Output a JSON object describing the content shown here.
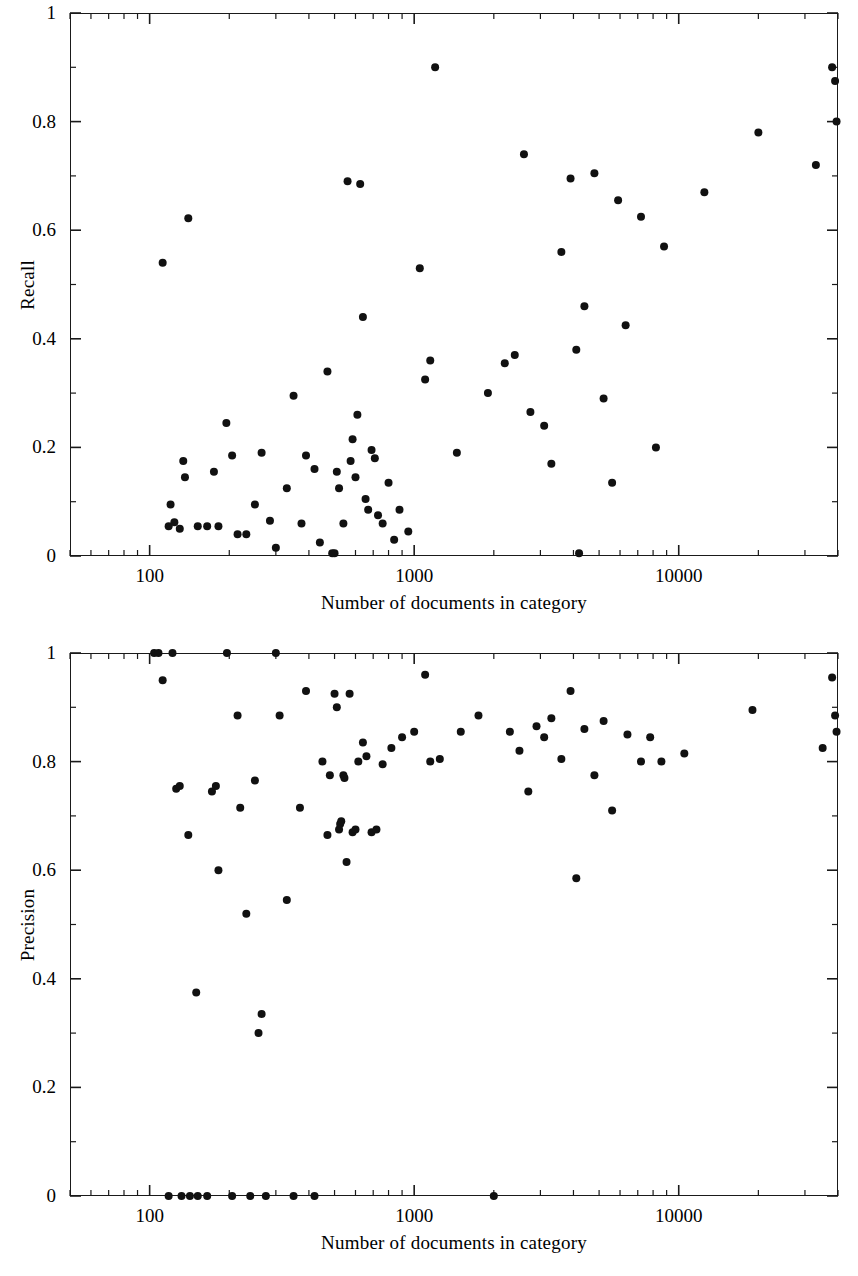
{
  "figure": {
    "background": "#ffffff",
    "ink_color": "#111111",
    "panel_count": 2
  },
  "chart_data": [
    {
      "type": "scatter",
      "id": "recall-vs-category-size",
      "title": "",
      "xlabel": "Number of documents in category",
      "ylabel": "Recall",
      "xscale": "log",
      "yscale": "linear",
      "xlim": [
        50,
        40000
      ],
      "ylim": [
        0,
        1
      ],
      "grid": false,
      "legend": null,
      "xticks_major": [
        100,
        1000,
        10000
      ],
      "xtick_labels": [
        "100",
        "1000",
        "10000"
      ],
      "yticks_major": [
        0,
        0.2,
        0.4,
        0.6,
        0.8,
        1
      ],
      "ytick_labels": [
        "0",
        "0.2",
        "0.4",
        "0.6",
        "0.8",
        "1"
      ],
      "yticks_minor": [
        0.1,
        0.3,
        0.5,
        0.7,
        0.9
      ],
      "marker": "filled-circle",
      "marker_color": "#111111",
      "points": [
        [
          112,
          0.54
        ],
        [
          118,
          0.055
        ],
        [
          120,
          0.095
        ],
        [
          124,
          0.062
        ],
        [
          130,
          0.05
        ],
        [
          134,
          0.175
        ],
        [
          136,
          0.145
        ],
        [
          140,
          0.622
        ],
        [
          152,
          0.055
        ],
        [
          165,
          0.055
        ],
        [
          175,
          0.155
        ],
        [
          182,
          0.055
        ],
        [
          195,
          0.245
        ],
        [
          205,
          0.185
        ],
        [
          215,
          0.04
        ],
        [
          232,
          0.04
        ],
        [
          250,
          0.095
        ],
        [
          265,
          0.19
        ],
        [
          285,
          0.065
        ],
        [
          300,
          0.015
        ],
        [
          330,
          0.125
        ],
        [
          350,
          0.295
        ],
        [
          375,
          0.06
        ],
        [
          390,
          0.185
        ],
        [
          420,
          0.16
        ],
        [
          440,
          0.025
        ],
        [
          470,
          0.34
        ],
        [
          490,
          0.005
        ],
        [
          500,
          0.005
        ],
        [
          510,
          0.155
        ],
        [
          520,
          0.125
        ],
        [
          540,
          0.06
        ],
        [
          560,
          0.69
        ],
        [
          575,
          0.175
        ],
        [
          585,
          0.215
        ],
        [
          600,
          0.145
        ],
        [
          610,
          0.26
        ],
        [
          625,
          0.685
        ],
        [
          640,
          0.44
        ],
        [
          655,
          0.105
        ],
        [
          670,
          0.085
        ],
        [
          690,
          0.195
        ],
        [
          710,
          0.18
        ],
        [
          730,
          0.075
        ],
        [
          760,
          0.06
        ],
        [
          800,
          0.135
        ],
        [
          840,
          0.03
        ],
        [
          880,
          0.085
        ],
        [
          950,
          0.045
        ],
        [
          1050,
          0.53
        ],
        [
          1100,
          0.325
        ],
        [
          1150,
          0.36
        ],
        [
          1200,
          0.9
        ],
        [
          1450,
          0.19
        ],
        [
          1900,
          0.3
        ],
        [
          2200,
          0.355
        ],
        [
          2400,
          0.37
        ],
        [
          2600,
          0.74
        ],
        [
          2750,
          0.265
        ],
        [
          3100,
          0.24
        ],
        [
          3300,
          0.17
        ],
        [
          3600,
          0.56
        ],
        [
          3900,
          0.695
        ],
        [
          4100,
          0.38
        ],
        [
          4200,
          0.005
        ],
        [
          4400,
          0.46
        ],
        [
          4800,
          0.705
        ],
        [
          5200,
          0.29
        ],
        [
          5600,
          0.135
        ],
        [
          5900,
          0.655
        ],
        [
          6300,
          0.425
        ],
        [
          7200,
          0.625
        ],
        [
          8200,
          0.2
        ],
        [
          8800,
          0.57
        ],
        [
          12500,
          0.67
        ],
        [
          20000,
          0.78
        ],
        [
          33000,
          0.72
        ],
        [
          38000,
          0.9
        ],
        [
          39000,
          0.875
        ],
        [
          39500,
          0.8
        ]
      ]
    },
    {
      "type": "scatter",
      "id": "precision-vs-category-size",
      "title": "",
      "xlabel": "Number of documents in category",
      "ylabel": "Precision",
      "xscale": "log",
      "yscale": "linear",
      "xlim": [
        50,
        40000
      ],
      "ylim": [
        0,
        1
      ],
      "grid": false,
      "legend": null,
      "xticks_major": [
        100,
        1000,
        10000
      ],
      "xtick_labels": [
        "100",
        "1000",
        "10000"
      ],
      "yticks_major": [
        0,
        0.2,
        0.4,
        0.6,
        0.8,
        1
      ],
      "ytick_labels": [
        "0",
        "0.2",
        "0.4",
        "0.6",
        "0.8",
        "1"
      ],
      "yticks_minor": [
        0.1,
        0.3,
        0.5,
        0.7,
        0.9
      ],
      "marker": "filled-circle",
      "marker_color": "#111111",
      "points": [
        [
          104,
          1.0
        ],
        [
          108,
          1.0
        ],
        [
          112,
          0.95
        ],
        [
          118,
          0.0
        ],
        [
          122,
          1.0
        ],
        [
          126,
          0.75
        ],
        [
          130,
          0.755
        ],
        [
          132,
          0.0
        ],
        [
          140,
          0.665
        ],
        [
          142,
          0.0
        ],
        [
          150,
          0.375
        ],
        [
          152,
          0.0
        ],
        [
          165,
          0.0
        ],
        [
          172,
          0.745
        ],
        [
          178,
          0.755
        ],
        [
          182,
          0.6
        ],
        [
          196,
          1.0
        ],
        [
          205,
          0.0
        ],
        [
          215,
          0.885
        ],
        [
          220,
          0.715
        ],
        [
          232,
          0.52
        ],
        [
          240,
          0.0
        ],
        [
          250,
          0.765
        ],
        [
          258,
          0.3
        ],
        [
          265,
          0.335
        ],
        [
          275,
          0.0
        ],
        [
          300,
          1.0
        ],
        [
          310,
          0.885
        ],
        [
          330,
          0.545
        ],
        [
          350,
          0.0
        ],
        [
          370,
          0.715
        ],
        [
          390,
          0.93
        ],
        [
          420,
          0.0
        ],
        [
          450,
          0.8
        ],
        [
          470,
          0.665
        ],
        [
          480,
          0.775
        ],
        [
          500,
          0.925
        ],
        [
          510,
          0.9
        ],
        [
          520,
          0.675
        ],
        [
          525,
          0.685
        ],
        [
          530,
          0.69
        ],
        [
          540,
          0.775
        ],
        [
          545,
          0.77
        ],
        [
          555,
          0.615
        ],
        [
          570,
          0.925
        ],
        [
          585,
          0.67
        ],
        [
          600,
          0.675
        ],
        [
          615,
          0.8
        ],
        [
          640,
          0.835
        ],
        [
          660,
          0.81
        ],
        [
          690,
          0.67
        ],
        [
          720,
          0.675
        ],
        [
          760,
          0.795
        ],
        [
          820,
          0.825
        ],
        [
          900,
          0.845
        ],
        [
          1000,
          0.855
        ],
        [
          1100,
          0.96
        ],
        [
          1150,
          0.8
        ],
        [
          1250,
          0.805
        ],
        [
          1500,
          0.855
        ],
        [
          1750,
          0.885
        ],
        [
          2000,
          0.0
        ],
        [
          2300,
          0.855
        ],
        [
          2500,
          0.82
        ],
        [
          2700,
          0.745
        ],
        [
          2900,
          0.865
        ],
        [
          3100,
          0.845
        ],
        [
          3300,
          0.88
        ],
        [
          3600,
          0.805
        ],
        [
          3900,
          0.93
        ],
        [
          4100,
          0.585
        ],
        [
          4400,
          0.86
        ],
        [
          4800,
          0.775
        ],
        [
          5200,
          0.875
        ],
        [
          5600,
          0.71
        ],
        [
          6400,
          0.85
        ],
        [
          7200,
          0.8
        ],
        [
          7800,
          0.845
        ],
        [
          8600,
          0.8
        ],
        [
          10500,
          0.815
        ],
        [
          19000,
          0.895
        ],
        [
          35000,
          0.825
        ],
        [
          38000,
          0.955
        ],
        [
          39000,
          0.885
        ],
        [
          39500,
          0.855
        ]
      ]
    }
  ]
}
